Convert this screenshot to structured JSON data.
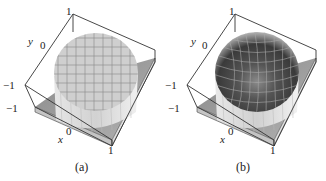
{
  "figure": {
    "panels": [
      {
        "id": "a",
        "caption": "(a)",
        "surface": "flat-top cylinder (disk plateau) with square grid",
        "shading": "uniform light gray",
        "axis_labels": {
          "x": "x",
          "y": "y"
        },
        "ticks": {
          "y_top": "1",
          "y_mid": "0",
          "y_bottom": "−1",
          "x_left": "−1",
          "x_mid": "0",
          "x_right": "1"
        }
      },
      {
        "id": "b",
        "caption": "(b)",
        "surface": "hemispherical bowl (spherical cap) with curved grid",
        "shading": "dark gradient, lighter at rim",
        "axis_labels": {
          "x": "x",
          "y": "y"
        },
        "ticks": {
          "y_top": "1",
          "y_mid": "0",
          "y_bottom": "−1",
          "x_left": "−1",
          "x_mid": "0",
          "x_right": "1"
        }
      }
    ],
    "colors": {
      "box_line": "#333333",
      "floor": "#9a9a9a",
      "plateau": "#c8c8c8",
      "grid": "#8a8a8a",
      "bowl_dark": "#3a3a3a",
      "bowl_light": "#bdbdbd"
    }
  }
}
